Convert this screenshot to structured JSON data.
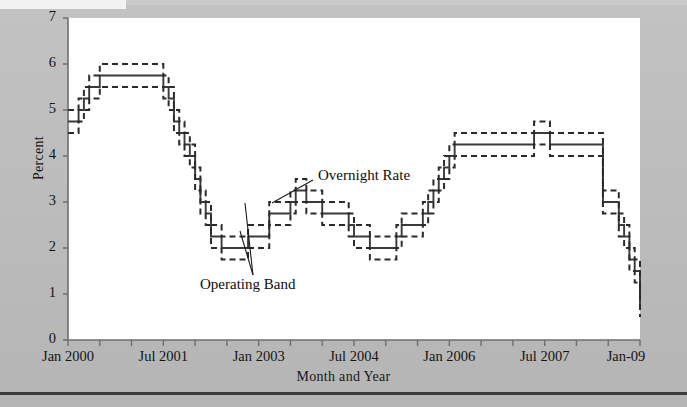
{
  "chart_data": {
    "type": "line",
    "title": "",
    "xlabel": "Month and Year",
    "ylabel": "Percent",
    "ylim": [
      0,
      7
    ],
    "yticks": [
      0,
      1,
      2,
      3,
      4,
      5,
      6,
      7
    ],
    "ytick_labels": [
      "0",
      "1",
      "2",
      "3",
      "4",
      "5",
      "6",
      "7"
    ],
    "xlim": [
      0,
      108
    ],
    "xtick_labels": [
      "Jan 2000",
      "Jul 2001",
      "Jan 2003",
      "Jul 2004",
      "Jan 2006",
      "Jul 2007",
      "Jan-09"
    ],
    "xtick_values": [
      0,
      18,
      36,
      54,
      72,
      90,
      108
    ],
    "xminor_step_months": 6,
    "grid": false,
    "legend_position": "inline-annotations",
    "annotations": [
      {
        "text": "Overnight Rate",
        "x_month": 47,
        "y_value": 3.45
      },
      {
        "text": "Operating Band",
        "x_month": 28,
        "y_value": 1.22
      }
    ],
    "series": [
      {
        "name": "Overnight Rate",
        "style": "solid",
        "color": "#3a3a3a",
        "x": [
          0,
          2,
          3,
          4,
          6,
          7,
          17,
          18,
          19,
          20,
          21,
          22,
          23,
          24,
          25,
          26,
          27,
          29,
          33,
          34,
          38,
          39,
          41,
          42,
          43,
          44,
          45,
          46,
          48,
          50,
          53,
          54,
          57,
          58,
          62,
          63,
          66,
          67,
          68,
          69,
          70,
          71,
          72,
          73,
          74,
          75,
          79,
          88,
          89,
          90,
          91,
          100,
          101,
          102,
          103,
          104,
          105,
          106,
          107,
          108
        ],
        "y": [
          4.75,
          5.0,
          5.25,
          5.5,
          5.75,
          5.75,
          5.75,
          5.5,
          5.25,
          4.75,
          4.5,
          4.25,
          4.0,
          3.5,
          3.0,
          2.75,
          2.25,
          2.0,
          2.0,
          2.25,
          2.75,
          2.75,
          2.75,
          3.0,
          3.25,
          3.25,
          3.0,
          3.0,
          2.75,
          2.75,
          2.5,
          2.25,
          2.0,
          2.0,
          2.25,
          2.5,
          2.5,
          2.75,
          3.0,
          3.25,
          3.5,
          3.75,
          4.0,
          4.25,
          4.25,
          4.25,
          4.25,
          4.5,
          4.5,
          4.5,
          4.25,
          4.25,
          3.0,
          3.0,
          3.0,
          2.5,
          2.25,
          1.75,
          1.5,
          0.75
        ]
      },
      {
        "name": "Operating Band Upper",
        "style": "dashed",
        "color": "#2a2a2a",
        "offset": 0.25
      },
      {
        "name": "Operating Band Lower",
        "style": "dashed",
        "color": "#2a2a2a",
        "offset": -0.25
      }
    ]
  },
  "figure": {
    "background_color": "#bdbdbd",
    "plot_background_color": "#ffffff",
    "axis_color": "#6e6e6e"
  }
}
